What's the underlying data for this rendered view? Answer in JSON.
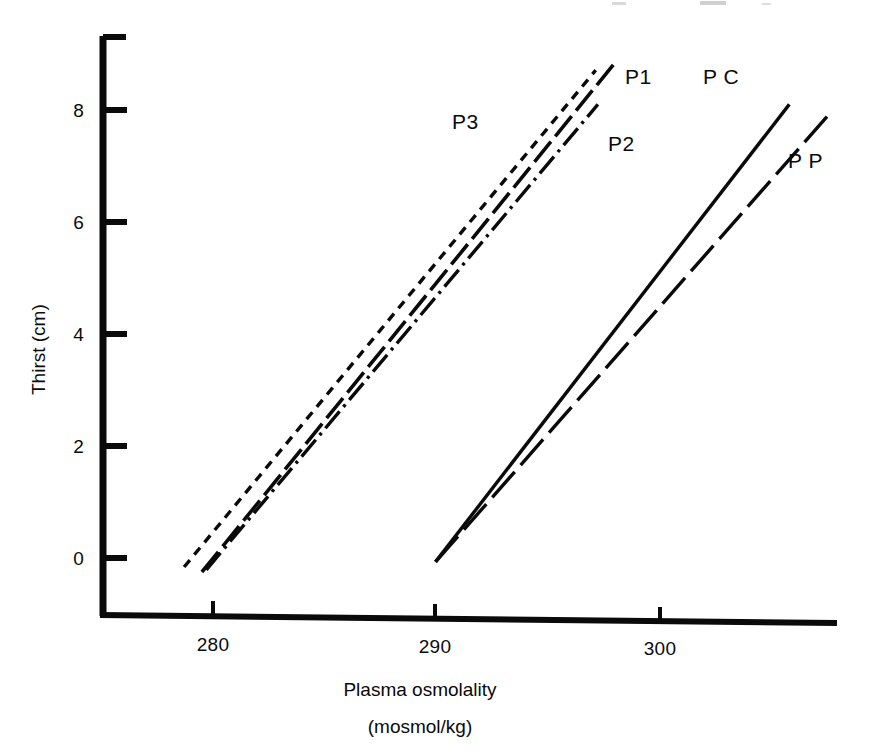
{
  "figure": {
    "kind": "scientific-line-plot",
    "background_color": "#ffffff",
    "ink_color": "#0a0a0a"
  },
  "axes": {
    "x_title_line1": "Plasma osmolality",
    "x_title_line2": "(mosmol/kg)",
    "y_title": "Thirst (cm)",
    "x_ticks": [
      "280",
      "290",
      "300"
    ],
    "y_ticks": [
      "0",
      "2",
      "4",
      "6",
      "8"
    ]
  },
  "chart_data": {
    "type": "line",
    "title": "",
    "xlabel": "Plasma osmolality (mosmol/kg)",
    "ylabel": "Thirst (cm)",
    "xlim": [
      275.5,
      308.5
    ],
    "ylim": [
      -1.0,
      9.0
    ],
    "xticks": [
      280,
      290,
      300
    ],
    "yticks": [
      0,
      2,
      4,
      6,
      8
    ],
    "grid": false,
    "legend": "inline-labels-at-line-ends",
    "series": [
      {
        "name": "P1",
        "label": "P1",
        "linestyle": "long-dash",
        "dasharray": "26 7",
        "linewidth": 3.6,
        "x": [
          279.5,
          298.1
        ],
        "y": [
          -0.25,
          8.86
        ],
        "slope": 0.49,
        "x_at_y0": 280.0,
        "label_x": 298.8,
        "label_y": 8.55
      },
      {
        "name": "P3",
        "label": "P3",
        "linestyle": "short-dash",
        "dasharray": "9 7",
        "linewidth": 3.4,
        "x": [
          278.7,
          297.2
        ],
        "y": [
          -0.16,
          8.71
        ],
        "slope": 0.48,
        "x_at_y0": 279.0,
        "label_x": 291.0,
        "label_y": 7.75
      },
      {
        "name": "P2",
        "label": "P2",
        "linestyle": "dash-dot",
        "dasharray": "22 6 3 6",
        "linewidth": 3.4,
        "x": [
          279.7,
          297.3
        ],
        "y": [
          -0.21,
          8.1
        ],
        "slope": 0.47,
        "x_at_y0": 280.2,
        "label_x": 298.0,
        "label_y": 7.35
      },
      {
        "name": "PC",
        "label": "P C",
        "linestyle": "solid",
        "dasharray": "",
        "linewidth": 3.4,
        "x": [
          290.0,
          305.9
        ],
        "y": [
          -0.07,
          8.1
        ],
        "slope": 0.51,
        "x_at_y0": 290.1,
        "label_x": 302.3,
        "label_y": 8.55
      },
      {
        "name": "PP",
        "label": "P P",
        "linestyle": "long-dash",
        "dasharray": "34 9",
        "linewidth": 3.4,
        "x": [
          290.0,
          307.7
        ],
        "y": [
          -0.07,
          7.93
        ],
        "slope": 0.45,
        "x_at_y0": 290.1,
        "label_x": 306.1,
        "label_y": 7.05
      }
    ]
  }
}
